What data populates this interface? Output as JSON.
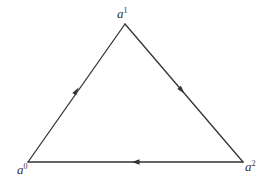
{
  "diagram": {
    "type": "directed-triangle",
    "vertices": [
      {
        "id": "a0",
        "base": "a",
        "superscript": "0",
        "x": 28,
        "y": 162
      },
      {
        "id": "a1",
        "base": "a",
        "superscript": "1",
        "x": 125,
        "y": 24
      },
      {
        "id": "a2",
        "base": "a",
        "superscript": "2",
        "x": 243,
        "y": 162
      }
    ],
    "edges": [
      {
        "from": "a0",
        "to": "a1",
        "direction": "up"
      },
      {
        "from": "a1",
        "to": "a2",
        "direction": "down"
      },
      {
        "from": "a2",
        "to": "a0",
        "direction": "left"
      }
    ],
    "colors": {
      "stroke": "#333333",
      "background": "#ffffff"
    }
  }
}
